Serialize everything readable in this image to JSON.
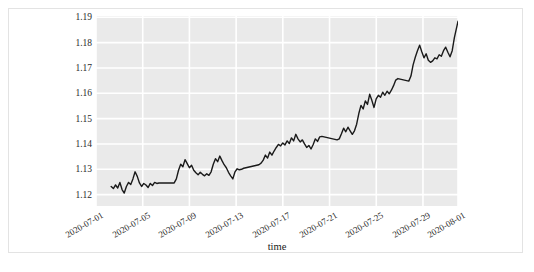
{
  "figure": {
    "background_color": "#ffffff",
    "frame_color": "#e3e3e3",
    "plot_background_color": "#eaeaea",
    "grid_color": "#ffffff",
    "line_color": "#1a1a1a"
  },
  "chart_data": {
    "type": "line",
    "title": "",
    "xlabel": "time",
    "ylabel": "",
    "grid": true,
    "legend": "none",
    "ylim": [
      1.1155,
      1.1905
    ],
    "ytick_labels": [
      "1.19",
      "1.18",
      "1.17",
      "1.16",
      "1.15",
      "1.14",
      "1.13",
      "1.12"
    ],
    "ytick_values": [
      1.19,
      1.18,
      1.17,
      1.16,
      1.15,
      1.14,
      1.13,
      1.12
    ],
    "xtick_labels": [
      "2020-07-01",
      "2020-07-05",
      "2020-07-09",
      "2020-07-13",
      "2020-07-17",
      "2020-07-21",
      "2020-07-25",
      "2020-07-29",
      "2020-08-01"
    ],
    "xlim": [
      "2020-07-01",
      "2020-08-01"
    ],
    "series": [
      {
        "name": "rate",
        "color": "#1a1a1a",
        "x": [
          0.042,
          0.048,
          0.054,
          0.06,
          0.066,
          0.072,
          0.078,
          0.084,
          0.09,
          0.096,
          0.102,
          0.108,
          0.114,
          0.12,
          0.126,
          0.132,
          0.138,
          0.144,
          0.15,
          0.156,
          0.162,
          0.168,
          0.174,
          0.18,
          0.186,
          0.192,
          0.198,
          0.204,
          0.21,
          0.216,
          0.222,
          0.228,
          0.234,
          0.24,
          0.246,
          0.252,
          0.258,
          0.264,
          0.27,
          0.276,
          0.282,
          0.288,
          0.294,
          0.3,
          0.306,
          0.312,
          0.318,
          0.324,
          0.33,
          0.336,
          0.342,
          0.348,
          0.354,
          0.36,
          0.366,
          0.372,
          0.378,
          0.384,
          0.39,
          0.396,
          0.402,
          0.408,
          0.414,
          0.42,
          0.426,
          0.432,
          0.438,
          0.444,
          0.45,
          0.456,
          0.462,
          0.468,
          0.474,
          0.48,
          0.486,
          0.492,
          0.498,
          0.504,
          0.51,
          0.516,
          0.522,
          0.528,
          0.534,
          0.54,
          0.546,
          0.552,
          0.558,
          0.564,
          0.57,
          0.576,
          0.582,
          0.588,
          0.594,
          0.6,
          0.606,
          0.612,
          0.618,
          0.624,
          0.63,
          0.636,
          0.642,
          0.648,
          0.654,
          0.66,
          0.666,
          0.672,
          0.678,
          0.684,
          0.69,
          0.696,
          0.702,
          0.708,
          0.714,
          0.72,
          0.726,
          0.732,
          0.738,
          0.744,
          0.75,
          0.756,
          0.762,
          0.768,
          0.774,
          0.78,
          0.786,
          0.792,
          0.798,
          0.804,
          0.81,
          0.816,
          0.822,
          0.828,
          0.834,
          0.84,
          0.846,
          0.852,
          0.858,
          0.864,
          0.87,
          0.876,
          0.882,
          0.888,
          0.894,
          0.9,
          0.906,
          0.912,
          0.918,
          0.924,
          0.93,
          0.936,
          0.942,
          0.948,
          0.954,
          0.96,
          0.966,
          0.972,
          0.978,
          0.984,
          0.99,
          1.0
        ],
        "y": [
          1.1232,
          1.1224,
          1.1238,
          1.1226,
          1.1248,
          1.122,
          1.1206,
          1.1232,
          1.1248,
          1.124,
          1.1262,
          1.129,
          1.1272,
          1.1246,
          1.1232,
          1.1244,
          1.1238,
          1.1228,
          1.1244,
          1.1236,
          1.1248,
          1.1244,
          1.1246,
          1.1246,
          1.1246,
          1.1246,
          1.1246,
          1.1246,
          1.1246,
          1.1246,
          1.1262,
          1.1296,
          1.132,
          1.131,
          1.1338,
          1.1322,
          1.1306,
          1.1316,
          1.1296,
          1.1286,
          1.1278,
          1.1288,
          1.128,
          1.1274,
          1.1282,
          1.1276,
          1.129,
          1.132,
          1.1342,
          1.133,
          1.1352,
          1.1334,
          1.1318,
          1.1306,
          1.1288,
          1.1274,
          1.1262,
          1.129,
          1.1302,
          1.1298,
          1.13,
          1.1304,
          1.1306,
          1.1308,
          1.131,
          1.1312,
          1.1314,
          1.1316,
          1.1318,
          1.1324,
          1.1336,
          1.1356,
          1.1344,
          1.1368,
          1.1356,
          1.1372,
          1.1386,
          1.1398,
          1.1392,
          1.1404,
          1.1396,
          1.1412,
          1.1402,
          1.1424,
          1.1412,
          1.1438,
          1.142,
          1.1408,
          1.1416,
          1.14,
          1.1386,
          1.1394,
          1.138,
          1.1398,
          1.142,
          1.141,
          1.1428,
          1.143,
          1.1428,
          1.1426,
          1.1424,
          1.1422,
          1.142,
          1.1418,
          1.1416,
          1.142,
          1.144,
          1.1462,
          1.1448,
          1.1466,
          1.1452,
          1.1438,
          1.1452,
          1.1478,
          1.152,
          1.1552,
          1.1538,
          1.157,
          1.1556,
          1.1596,
          1.1572,
          1.1544,
          1.1578,
          1.1592,
          1.1584,
          1.1604,
          1.1592,
          1.1608,
          1.1598,
          1.1612,
          1.163,
          1.1652,
          1.1658,
          1.1656,
          1.1654,
          1.1652,
          1.165,
          1.1648,
          1.1668,
          1.1712,
          1.1742,
          1.1768,
          1.179,
          1.1764,
          1.174,
          1.1756,
          1.173,
          1.1722,
          1.1728,
          1.174,
          1.1736,
          1.1752,
          1.1746,
          1.1768,
          1.1782,
          1.1762,
          1.1744,
          1.1768,
          1.182,
          1.1884
        ]
      }
    ]
  }
}
